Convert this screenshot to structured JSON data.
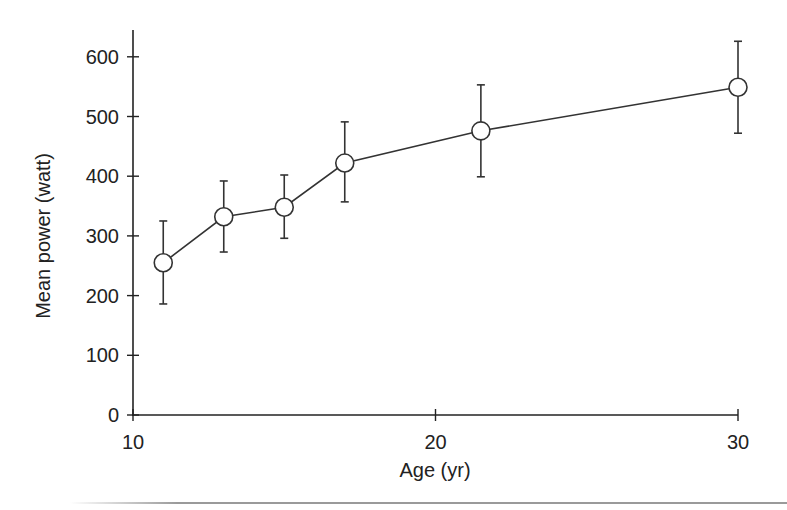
{
  "chart_data": {
    "type": "line",
    "title": "",
    "xlabel": "Age (yr)",
    "ylabel": "Mean power (watt)",
    "xlim": [
      10,
      30
    ],
    "ylim": [
      0,
      640
    ],
    "xticks": [
      10,
      20,
      30
    ],
    "yticks": [
      0,
      100,
      200,
      300,
      400,
      500,
      600
    ],
    "grid": false,
    "legend": null,
    "marker": "open-circle",
    "error_bars": true,
    "series": [
      {
        "name": "Mean power",
        "x": [
          11,
          13,
          15,
          17,
          21.5,
          30
        ],
        "y": [
          255,
          332,
          348,
          422,
          476,
          549
        ],
        "error_upper": [
          325,
          392,
          402,
          491,
          553,
          626
        ],
        "error_lower": [
          186,
          273,
          296,
          357,
          399,
          472
        ]
      }
    ]
  },
  "colors": {
    "axis": "#222222",
    "line": "#333333",
    "marker_fill": "#ffffff",
    "background": "#ffffff",
    "bottom_rule": "#9a9a9a"
  }
}
